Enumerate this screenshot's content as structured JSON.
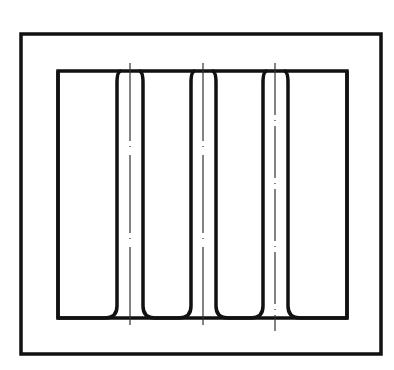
{
  "diagram": {
    "type": "technical-drawing",
    "colors": {
      "background": "#ffffff",
      "stroke": "#111111",
      "centerline": "#333333"
    },
    "outer_frame": {
      "x": 21,
      "y": 34,
      "width": 360,
      "height": 320,
      "stroke_width": 3.5
    },
    "inner_frame": {
      "x": 58,
      "y": 71,
      "width": 289,
      "height": 247,
      "stroke_width": 3.5
    },
    "openings": [
      {
        "id": 1,
        "left": 58,
        "right": 117,
        "round_left": false,
        "round_right": true
      },
      {
        "id": 2,
        "left": 143,
        "right": 191,
        "round_left": true,
        "round_right": true
      },
      {
        "id": 3,
        "left": 216,
        "right": 263,
        "round_left": true,
        "round_right": true
      },
      {
        "id": 4,
        "left": 288,
        "right": 347,
        "round_left": true,
        "round_right": false
      }
    ],
    "centerlines": [
      {
        "id": 1,
        "x": 130,
        "y_top": 63,
        "y_bottom": 328,
        "style": "dash-dot"
      },
      {
        "id": 2,
        "x": 203,
        "y_top": 63,
        "y_bottom": 328,
        "style": "dash-dot"
      },
      {
        "id": 3,
        "x": 275,
        "y_top": 63,
        "y_bottom": 331,
        "style": "dash-dot"
      }
    ],
    "corner_radius": 12
  }
}
